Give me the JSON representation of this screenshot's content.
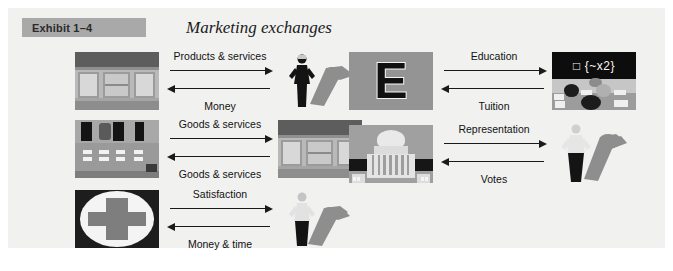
{
  "exhibit": {
    "number": "Exhibit 1–4",
    "title": "Marketing exchanges",
    "band_color": "#a9a9a9",
    "panel_background": "#f1f1f0"
  },
  "rows": [
    {
      "id": "retail-consumer",
      "left_image": "storefront",
      "right_image": "woman-figure",
      "forward_label": "Products & services",
      "backward_label": "Money"
    },
    {
      "id": "wholesale-retail",
      "left_image": "bank-counter",
      "right_image": "storefront",
      "forward_label": "Goods & services",
      "backward_label": "Goods & services"
    },
    {
      "id": "hospital-patient",
      "left_image": "hospital-cross",
      "right_image": "person-figure",
      "forward_label": "Satisfaction",
      "backward_label": "Money & time"
    },
    {
      "id": "school-students",
      "left_image": "letter-e-block",
      "right_image": "classroom",
      "forward_label": "Education",
      "backward_label": "Tuition"
    },
    {
      "id": "government-citizen",
      "left_image": "capitol-building",
      "right_image": "person-figure",
      "forward_label": "Representation",
      "backward_label": "Votes"
    }
  ],
  "classroom": {
    "board_text": "□ {~x2}"
  },
  "letter_block": {
    "glyph": "E"
  }
}
